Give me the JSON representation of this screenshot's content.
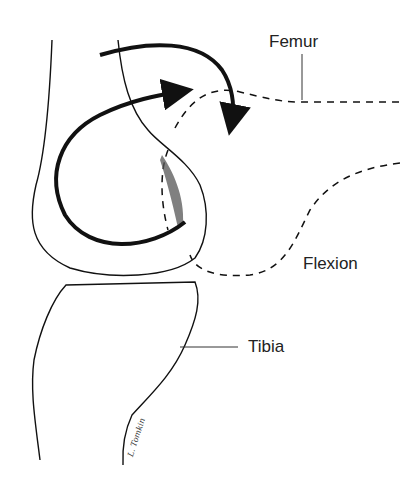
{
  "diagram": {
    "type": "anatomical-line-drawing",
    "labels": {
      "femur": "Femur",
      "flexion": "Flexion",
      "tibia": "Tibia"
    },
    "signature": "L. Tomkin",
    "colors": {
      "line": "#111111",
      "background": "#ffffff",
      "label": "#222222"
    }
  }
}
